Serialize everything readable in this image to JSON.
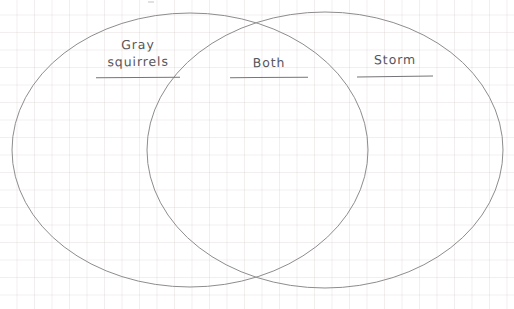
{
  "worksheet": {
    "type": "venn-diagram",
    "width": 514,
    "height": 309,
    "background_color": "#ffffff",
    "grid_color": "#d6c8c8",
    "grid_spacing_px": 17.5,
    "stroke_color": "#8d8d8d",
    "text_color": "#55555a",
    "rule_color": "#75757a"
  },
  "labels": {
    "left": {
      "name": "Gray squirrels",
      "line1": "Gray",
      "line2": "squirrels",
      "region": "left-only"
    },
    "center": {
      "name": "Both",
      "line1": "Both",
      "region": "intersection"
    },
    "right": {
      "name": "Storm",
      "line1": "Storm",
      "region": "right-only"
    }
  },
  "circles": [
    {
      "id": "left-circle",
      "cx": 190,
      "cy": 150,
      "rx": 178,
      "ry": 137
    },
    {
      "id": "right-circle",
      "cx": 325,
      "cy": 150,
      "rx": 178,
      "ry": 138
    }
  ]
}
